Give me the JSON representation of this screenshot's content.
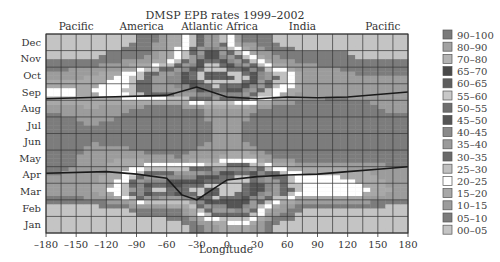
{
  "chart_data": {
    "type": "heatmap",
    "title": "DMSP EPB rates 1999–2002",
    "xlabel": "Longitude",
    "ylabel": "",
    "xlim": [
      -180,
      180
    ],
    "x_ticks": [
      "–180",
      "–150",
      "–120",
      "–90",
      "–60",
      "–30",
      "0",
      "30",
      "60",
      "90",
      "120",
      "150",
      "180"
    ],
    "x_tick_values": [
      -180,
      -150,
      -120,
      -90,
      -60,
      -30,
      0,
      30,
      60,
      90,
      120,
      150,
      180
    ],
    "y_categories": [
      "Jan",
      "Feb",
      "Mar",
      "Apr",
      "May",
      "Jun",
      "Jul",
      "Aug",
      "Sep",
      "Oct",
      "Nov",
      "Dec"
    ],
    "region_labels": [
      {
        "name": "Pacific",
        "longitude": -150
      },
      {
        "name": "America",
        "longitude": -85
      },
      {
        "name": "Atlantic",
        "longitude": -25
      },
      {
        "name": "Africa",
        "longitude": 15
      },
      {
        "name": "India",
        "longitude": 75
      },
      {
        "name": "Pacific",
        "longitude": 155
      }
    ],
    "grid": true,
    "legend": {
      "placement": "right",
      "title": "",
      "entries": [
        {
          "label": "90–100",
          "color": "#7a7a7a"
        },
        {
          "label": "80–90",
          "color": "#a2a2a2"
        },
        {
          "label": "70–80",
          "color": "#b4b4b4"
        },
        {
          "label": "65–70",
          "color": "#4a4a4a"
        },
        {
          "label": "60–65",
          "color": "#5e5e5e"
        },
        {
          "label": "55–60",
          "color": "#c8c8c8"
        },
        {
          "label": "50–55",
          "color": "#6e6e6e"
        },
        {
          "label": "45–50",
          "color": "#555555"
        },
        {
          "label": "40–45",
          "color": "#8a8a8a"
        },
        {
          "label": "35–40",
          "color": "#9a9a9a"
        },
        {
          "label": "30–35",
          "color": "#6a6a6a"
        },
        {
          "label": "25–30",
          "color": "#c0c0c0"
        },
        {
          "label": "20–25",
          "color": "#ffffff"
        },
        {
          "label": "15–20",
          "color": "#a8a8a8"
        },
        {
          "label": "10–15",
          "color": "#9c9c9c"
        },
        {
          "label": "05–10",
          "color": "#7c7c7c"
        },
        {
          "label": "00–05",
          "color": "#c4c4c4"
        }
      ]
    },
    "overlay_lines": [
      {
        "name": "magnetic-equator-crossing-upper",
        "points": [
          [
            -180,
            8.1
          ],
          [
            -120,
            8.2
          ],
          [
            -60,
            8.3
          ],
          [
            -30,
            8.8
          ],
          [
            0,
            8.2
          ],
          [
            30,
            8.1
          ],
          [
            60,
            8.2
          ],
          [
            90,
            8.15
          ],
          [
            120,
            8.2
          ],
          [
            150,
            8.35
          ],
          [
            180,
            8.5
          ]
        ]
      },
      {
        "name": "magnetic-equator-crossing-lower",
        "points": [
          [
            -180,
            3.6
          ],
          [
            -120,
            3.7
          ],
          [
            -90,
            3.55
          ],
          [
            -60,
            3.3
          ],
          [
            -45,
            2.3
          ],
          [
            -30,
            2.0
          ],
          [
            -15,
            2.6
          ],
          [
            0,
            3.2
          ],
          [
            30,
            3.4
          ],
          [
            60,
            3.5
          ],
          [
            90,
            3.55
          ],
          [
            120,
            3.7
          ],
          [
            150,
            3.85
          ],
          [
            180,
            4.0
          ]
        ]
      }
    ],
    "approx_rate_grid_note": "Estimated EPB rate (%) per 30° longitude × month; rows Jan..Dec, cols centered at -165..165",
    "z": [
      [
        2,
        2,
        2,
        2,
        3,
        12,
        20,
        5,
        2,
        2,
        2,
        2
      ],
      [
        3,
        3,
        5,
        8,
        10,
        40,
        45,
        15,
        5,
        5,
        4,
        3
      ],
      [
        12,
        15,
        25,
        60,
        55,
        65,
        55,
        40,
        25,
        25,
        22,
        15
      ],
      [
        10,
        12,
        20,
        35,
        40,
        45,
        60,
        35,
        20,
        20,
        18,
        12
      ],
      [
        8,
        12,
        15,
        12,
        10,
        15,
        20,
        10,
        8,
        8,
        8,
        8
      ],
      [
        6,
        10,
        8,
        5,
        5,
        10,
        10,
        6,
        5,
        5,
        5,
        5
      ],
      [
        6,
        10,
        8,
        5,
        5,
        10,
        10,
        6,
        5,
        5,
        5,
        6
      ],
      [
        12,
        15,
        12,
        5,
        5,
        12,
        12,
        8,
        5,
        5,
        8,
        12
      ],
      [
        22,
        20,
        25,
        35,
        40,
        50,
        45,
        25,
        15,
        12,
        12,
        15
      ],
      [
        12,
        15,
        20,
        35,
        45,
        65,
        60,
        35,
        15,
        12,
        10,
        10
      ],
      [
        5,
        5,
        8,
        12,
        25,
        55,
        30,
        12,
        8,
        8,
        5,
        5
      ],
      [
        2,
        2,
        3,
        8,
        20,
        40,
        10,
        5,
        2,
        2,
        2,
        2
      ]
    ]
  }
}
